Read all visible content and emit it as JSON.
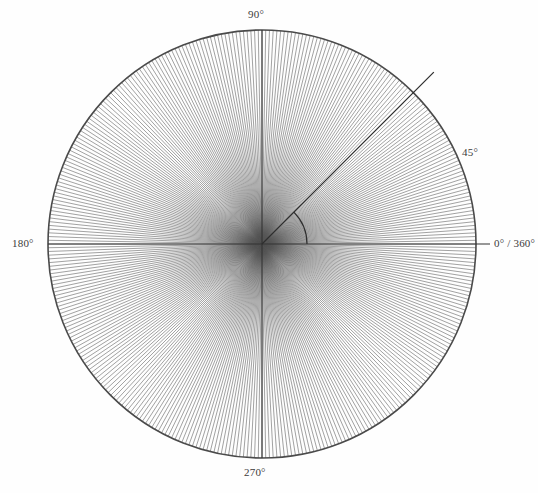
{
  "figure": {
    "title": "",
    "background_color": "#fefefe",
    "stroke_color": "#4a4a4a",
    "ray_color": "#555555",
    "axis_color": "#333333",
    "label_color": "#3b3b3b"
  },
  "labels": {
    "deg_90": "90°",
    "deg_270": "270°",
    "deg_180": "180°",
    "deg_0_360": "0° / 360°",
    "deg_45": "45°"
  },
  "chart_data": {
    "type": "scatter",
    "title": "",
    "subtitle": "",
    "xlabel": "",
    "ylabel": "",
    "grid": false,
    "legend": "none",
    "coordinate_system": "polar",
    "center": {
      "x": 262,
      "y": 244
    },
    "radius": 214,
    "ray_count": 360,
    "ray_angle_step_deg": 1,
    "angle_range_deg": [
      0,
      360
    ],
    "tick_labels": [
      "0° / 360°",
      "45°",
      "90°",
      "180°",
      "270°"
    ],
    "tick_angles_deg": [
      0,
      45,
      90,
      180,
      270
    ],
    "axes_drawn_deg": [
      0,
      90,
      180,
      270
    ],
    "annotations": [
      {
        "name": "angle-arc",
        "type": "arc",
        "start_deg": 0,
        "end_deg": 45,
        "radius_px": 45,
        "label": "45°"
      },
      {
        "name": "terminal-ray",
        "type": "radial-line",
        "angle_deg": 45,
        "extends_beyond_circle": true,
        "end_radius_px": 243
      }
    ]
  }
}
